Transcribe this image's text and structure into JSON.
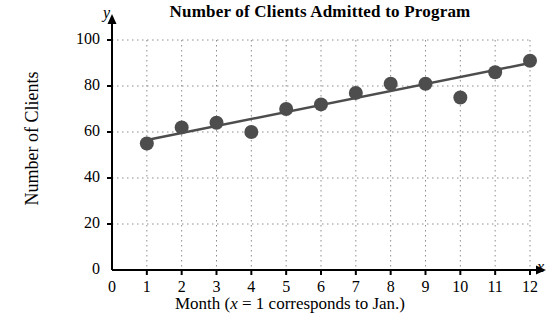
{
  "chart_data": {
    "type": "scatter",
    "title": "Number of Clients Admitted to Program",
    "xlabel": "Month (x = 1 corresponds to Jan.)",
    "ylabel": "Number of Clients",
    "x_axis_symbol": "x",
    "y_axis_symbol": "y",
    "x": [
      1,
      2,
      3,
      4,
      5,
      6,
      7,
      8,
      9,
      10,
      11,
      12
    ],
    "values": [
      55,
      62,
      64,
      60,
      70,
      72,
      77,
      81,
      81,
      75,
      86,
      91
    ],
    "xlim": [
      0,
      12
    ],
    "ylim": [
      0,
      100
    ],
    "xticks": [
      0,
      1,
      2,
      3,
      4,
      5,
      6,
      7,
      8,
      9,
      10,
      11,
      12
    ],
    "xtick_labels": [
      "0",
      "1",
      "2",
      "3",
      "4",
      "5",
      "6",
      "7",
      "8",
      "9",
      "10",
      "11",
      "12"
    ],
    "yticks": [
      0,
      20,
      40,
      60,
      80,
      100
    ],
    "ytick_labels": [
      "0",
      "20",
      "40",
      "60",
      "80",
      "100"
    ],
    "grid": true,
    "grid_style": "dotted",
    "legend": "none",
    "trendline": {
      "type": "line",
      "x": [
        1,
        12
      ],
      "y": [
        56.5,
        90.0
      ]
    },
    "colors": {
      "marker": "#4d4d4d",
      "trendline": "#4d4d4d",
      "axis": "#000000",
      "grid": "#8c8c8c",
      "background": "#ffffff"
    }
  }
}
